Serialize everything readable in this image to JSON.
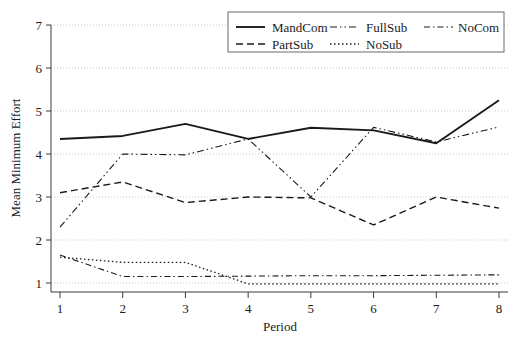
{
  "chart_data": {
    "type": "line",
    "title": "",
    "xlabel": "Period",
    "ylabel": "Mean Minimum Effort",
    "x": [
      1,
      2,
      3,
      4,
      5,
      6,
      7,
      8
    ],
    "xticklabels": [
      "1",
      "2",
      "3",
      "4",
      "5",
      "6",
      "7",
      "8"
    ],
    "yticklabels": [
      "1",
      "2",
      "3",
      "4",
      "5",
      "6",
      "7"
    ],
    "yticks": [
      1,
      2,
      3,
      4,
      5,
      6,
      7
    ],
    "xlim": [
      0.7,
      8.3
    ],
    "ylim": [
      0.75,
      7.15
    ],
    "grid": true,
    "grid_axis": "y",
    "legend_position": "top-right",
    "series": [
      {
        "name": "MandCom",
        "style": "solid",
        "color": "#111111",
        "width": 1.9,
        "dasharray": "none",
        "values": [
          4.35,
          4.42,
          4.7,
          4.35,
          4.61,
          4.55,
          4.25,
          5.25
        ]
      },
      {
        "name": "FullSub",
        "style": "dash-dot-dot",
        "color": "#444444",
        "width": 1.1,
        "dasharray": "7,3,1.5,3,1.5,3",
        "values": [
          2.3,
          4.0,
          3.98,
          4.35,
          3.0,
          4.62,
          4.28,
          4.63
        ]
      },
      {
        "name": "NoCom",
        "style": "dash-dot",
        "color": "#444444",
        "width": 1.1,
        "dasharray": "6,3,1.5,3",
        "values": [
          1.65,
          1.15,
          1.15,
          1.16,
          1.17,
          1.17,
          1.18,
          1.19
        ]
      },
      {
        "name": "PartSub",
        "style": "dashed",
        "color": "#222222",
        "width": 1.4,
        "dasharray": "7,4",
        "values": [
          3.1,
          3.35,
          2.87,
          3.0,
          2.98,
          2.35,
          3.0,
          2.74
        ]
      },
      {
        "name": "NoSub",
        "style": "dotted",
        "color": "#333333",
        "width": 1.3,
        "dasharray": "1.5,2.5",
        "values": [
          1.6,
          1.48,
          1.48,
          0.98,
          0.98,
          0.98,
          0.98,
          0.98
        ]
      }
    ],
    "legend_entries": [
      {
        "label": "MandCom",
        "style": "solid",
        "dasharray": "none",
        "width": 1.9
      },
      {
        "label": "FullSub",
        "style": "dash-dot-dot",
        "dasharray": "7,3,1.5,3,1.5,3",
        "width": 1.1
      },
      {
        "label": "NoCom",
        "style": "dash-dot",
        "dasharray": "6,3,1.5,3",
        "width": 1.1
      },
      {
        "label": "PartSub",
        "style": "dashed",
        "dasharray": "7,4",
        "width": 1.4
      },
      {
        "label": "NoSub",
        "style": "dotted",
        "dasharray": "1.5,2.5",
        "width": 1.3
      }
    ]
  },
  "axes": {
    "y_axis_title": "Mean Minimum Effort",
    "x_axis_title": "Period"
  },
  "colors": {
    "background": "#ffffff",
    "axis": "#3a3a3a",
    "grid": "#bdbdbd",
    "text": "#1a1a1a",
    "legend_border": "#6a6a6a"
  }
}
